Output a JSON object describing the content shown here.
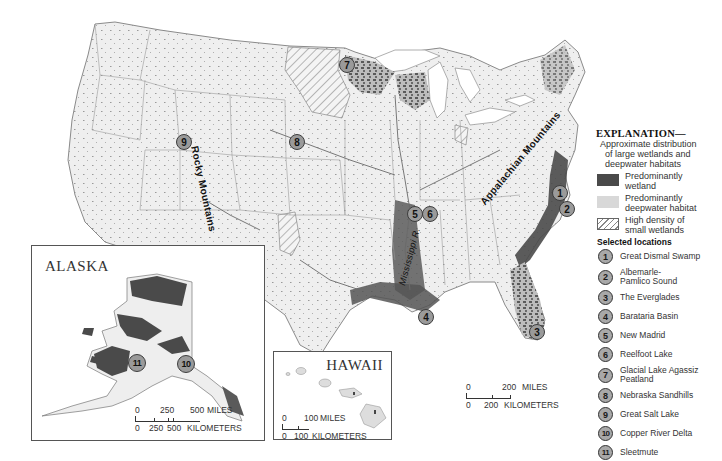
{
  "map": {
    "title": "Wetlands and deepwater habitats of the United States",
    "labels": {
      "rocky_mountains": "Rocky Mountains",
      "appalachian_mountains": "Appalachian Mountains",
      "mississippi_river": "Mississippi R."
    },
    "colors": {
      "land": "#efefef",
      "wetland": "#4a4a4a",
      "deepwater": "#d8d8d8",
      "marker_fill": "#9a9a9a",
      "border": "#7a7a7a"
    },
    "markers": [
      {
        "num": "1",
        "x": 552,
        "y": 185
      },
      {
        "num": "2",
        "x": 559,
        "y": 201
      },
      {
        "num": "3",
        "x": 529,
        "y": 324
      },
      {
        "num": "4",
        "x": 418,
        "y": 309
      },
      {
        "num": "5",
        "x": 407,
        "y": 206
      },
      {
        "num": "6",
        "x": 422,
        "y": 206
      },
      {
        "num": "7",
        "x": 339,
        "y": 57
      },
      {
        "num": "8",
        "x": 289,
        "y": 134
      },
      {
        "num": "9",
        "x": 176,
        "y": 134
      }
    ],
    "scale_main": {
      "miles_start": "0",
      "miles_end": "200",
      "miles_unit": "MILES",
      "km_start": "0",
      "km_mid": "200",
      "km_unit": "KILOMETERS"
    }
  },
  "alaska": {
    "title": "ALASKA",
    "markers": [
      {
        "num": "11"
      },
      {
        "num": "10"
      }
    ],
    "scale": {
      "miles_start": "0",
      "miles_mid": "250",
      "miles_end": "500",
      "miles_unit": "MILES",
      "km_start": "0",
      "km_mid1": "250",
      "km_mid2": "500",
      "km_unit": "KILOMETERS"
    }
  },
  "hawaii": {
    "title": "HAWAII",
    "scale": {
      "miles_start": "0",
      "miles_end": "100",
      "miles_unit": "MILES",
      "km_start": "0",
      "km_end": "100",
      "km_unit": "KILOMETERS"
    }
  },
  "legend": {
    "title": "EXPLANATION—",
    "subtitle": [
      "Approximate distribution",
      "of large wetlands and",
      "deepwater habitats"
    ],
    "categories": [
      {
        "key": "wetland",
        "label_1": "Predominantly",
        "label_2": "wetland"
      },
      {
        "key": "deepwater",
        "label_1": "Predominantly",
        "label_2": "deepwater habitat"
      },
      {
        "key": "small",
        "label_1": "High density of",
        "label_2": "small wetlands"
      }
    ],
    "selected_title": "Selected locations",
    "locations": [
      {
        "num": "1",
        "name": "Great Dismal Swamp"
      },
      {
        "num": "2",
        "name": "Albemarle-Pamlico Sound"
      },
      {
        "num": "3",
        "name": "The Everglades"
      },
      {
        "num": "4",
        "name": "Barataria Basin"
      },
      {
        "num": "5",
        "name": "New Madrid"
      },
      {
        "num": "6",
        "name": "Reelfoot Lake"
      },
      {
        "num": "7",
        "name": "Glacial Lake Agassiz Peatland"
      },
      {
        "num": "8",
        "name": "Nebraska Sandhills"
      },
      {
        "num": "9",
        "name": "Great Salt Lake"
      },
      {
        "num": "10",
        "name": "Copper River Delta"
      },
      {
        "num": "11",
        "name": "Sleetmute"
      }
    ]
  }
}
